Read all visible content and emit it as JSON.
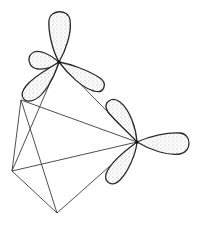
{
  "diagram": {
    "type": "molecular-orbital-sketch",
    "description": "Polyhedral framework with two vertices bearing three-lobed hybrid orbital sets",
    "colors": {
      "background": "#ffffff",
      "line": "#3a3a3a",
      "lobe_outline": "#2a2a2a",
      "stipple": "#555555"
    },
    "vertices": {
      "top_atom": [
        59,
        62
      ],
      "right_atom": [
        137,
        142
      ],
      "upper_left": [
        21,
        100
      ],
      "left": [
        12,
        171
      ],
      "bottom": [
        57,
        213
      ]
    },
    "edges": [
      [
        "top_atom",
        "right_atom"
      ],
      [
        "upper_left",
        "right_atom"
      ],
      [
        "left",
        "right_atom"
      ],
      [
        "bottom",
        "right_atom"
      ],
      [
        "upper_left",
        "left"
      ],
      [
        "upper_left",
        "bottom"
      ],
      [
        "top_atom",
        "left"
      ],
      [
        "left",
        "bottom"
      ]
    ],
    "orbital_sets": [
      {
        "atom": "top_atom",
        "lobes": [
          {
            "direction": "up",
            "length": 50
          },
          {
            "direction": "left",
            "length": 34
          },
          {
            "direction": "right-down",
            "length": 45
          },
          {
            "direction": "down-left",
            "length": 45
          }
        ]
      },
      {
        "atom": "right_atom",
        "lobes": [
          {
            "direction": "up-left",
            "length": 45
          },
          {
            "direction": "right",
            "length": 53
          },
          {
            "direction": "down-left",
            "length": 45
          }
        ]
      }
    ]
  }
}
